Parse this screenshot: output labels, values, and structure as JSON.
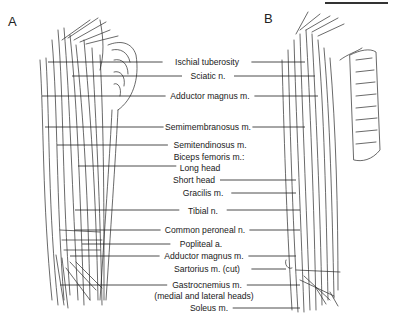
{
  "figure": {
    "panels": [
      {
        "letter": "A",
        "x": 8,
        "y": 14
      },
      {
        "letter": "B",
        "x": 264,
        "y": 11
      }
    ],
    "labels": [
      {
        "id": "ischial-tuberosity",
        "text": "Ischial tuberosity",
        "x": 207,
        "y": 57,
        "lineY": 62,
        "leftX": 48,
        "rightX": 305
      },
      {
        "id": "sciatic-n",
        "text": "Sciatic n.",
        "x": 208,
        "y": 71,
        "lineY": 76,
        "leftX": 72,
        "rightX": 315
      },
      {
        "id": "adductor-magnus-1",
        "text": "Adductor magnus m.",
        "x": 210,
        "y": 91,
        "lineY": 96,
        "leftX": 42,
        "rightX": 318
      },
      {
        "id": "semimembranosus",
        "text": "Semimembranosus m.",
        "x": 208,
        "y": 122,
        "lineY": 127,
        "leftX": 45,
        "rightX": 305
      },
      {
        "id": "semitendinosus",
        "text": "Semitendinosus m.",
        "x": 210,
        "y": 140,
        "lineY": 145,
        "leftX": 57,
        "rightX": null
      },
      {
        "id": "biceps-femoris",
        "text": "Biceps femoris m.:",
        "x": 209,
        "y": 152,
        "lineY": null,
        "leftX": null,
        "rightX": null
      },
      {
        "id": "long-head",
        "text": "Long head",
        "x": 200,
        "y": 163,
        "lineY": 166,
        "leftX": 78,
        "rightX": null
      },
      {
        "id": "short-head",
        "text": "Short head",
        "x": 194,
        "y": 175,
        "lineY": 180,
        "leftX": null,
        "rightX": 296
      },
      {
        "id": "gracilis",
        "text": "Gracilis m.",
        "x": 203,
        "y": 188,
        "lineY": 193,
        "leftX": null,
        "rightX": 296
      },
      {
        "id": "tibial-n",
        "text": "Tibial n.",
        "x": 203,
        "y": 206,
        "lineY": 210,
        "leftX": 75,
        "rightX": 300
      },
      {
        "id": "common-peroneal-n",
        "text": "Common peroneal n.",
        "x": 205,
        "y": 225,
        "lineY": 230,
        "leftX": 75,
        "rightX": 300
      },
      {
        "id": "popliteal-a",
        "text": "Popliteal a.",
        "x": 201,
        "y": 239,
        "lineY": 244,
        "leftX": 82,
        "rightX": null
      },
      {
        "id": "adductor-magnus-2",
        "text": "Adductor magnus m.",
        "x": 204,
        "y": 251,
        "lineY": 256,
        "leftX": 70,
        "rightX": 296
      },
      {
        "id": "sartorius",
        "text": "Sartorius m. (cut)",
        "x": 207,
        "y": 264,
        "lineY": 269,
        "leftX": null,
        "rightX": 286
      },
      {
        "id": "gastrocnemius",
        "text": "Gastrocnemius m.",
        "x": 207,
        "y": 280,
        "lineY": 285,
        "leftX": 60,
        "rightX": 300
      },
      {
        "id": "gastrocnemius-sub",
        "text": "(medial and lateral heads)",
        "x": 204,
        "y": 291,
        "lineY": null,
        "leftX": null,
        "rightX": null
      },
      {
        "id": "soleus",
        "text": "Soleus m.",
        "x": 209,
        "y": 303,
        "lineY": 308,
        "leftX": null,
        "rightX": 300
      }
    ]
  }
}
